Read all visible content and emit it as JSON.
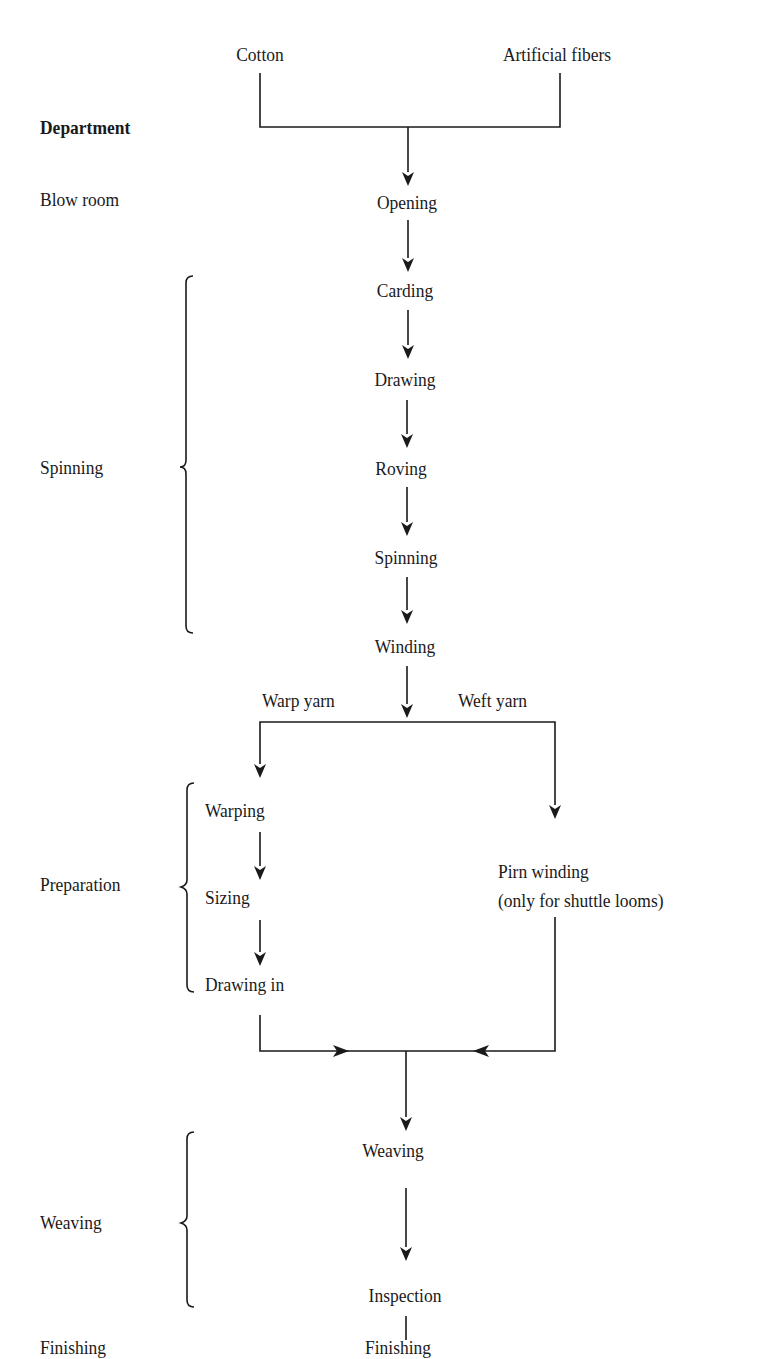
{
  "diagram": {
    "header": {
      "department_label": "Department"
    },
    "inputs": [
      {
        "id": "cotton",
        "label": "Cotton"
      },
      {
        "id": "artificial",
        "label": "Artificial fibers"
      }
    ],
    "departments": [
      {
        "id": "blow-room",
        "label": "Blow room"
      },
      {
        "id": "spinning",
        "label": "Spinning"
      },
      {
        "id": "preparation",
        "label": "Preparation"
      },
      {
        "id": "weaving",
        "label": "Weaving"
      },
      {
        "id": "finishing",
        "label": "Finishing"
      }
    ],
    "steps": {
      "opening": "Opening",
      "carding": "Carding",
      "drawing": "Drawing",
      "roving": "Roving",
      "spinning": "Spinning",
      "winding": "Winding",
      "warping": "Warping",
      "sizing": "Sizing",
      "drawing_in": "Drawing in",
      "pirn_winding": "Pirn winding",
      "pirn_note": "(only for shuttle looms)",
      "weaving": "Weaving",
      "inspection": "Inspection",
      "finishing": "Finishing"
    },
    "branches": {
      "warp": "Warp yarn",
      "weft": "Weft yarn"
    },
    "colors": {
      "line": "#1a1a1a",
      "background": "#ffffff"
    }
  }
}
